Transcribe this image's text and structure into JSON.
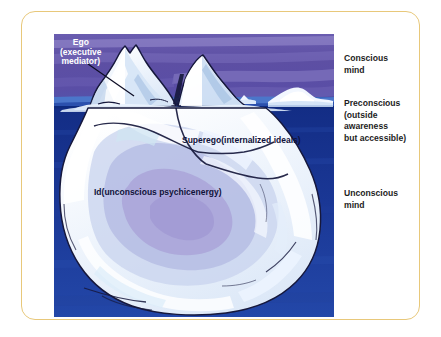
{
  "figure": {
    "frame_border_color": "#e8c87a",
    "background_color": "#ffffff"
  },
  "illustration": {
    "name": "freud-iceberg-illustration",
    "sky_color": "#5f51a4",
    "sky_light_band_color": "#8f86c4",
    "surface_water_color": "#2c56b4",
    "deep_water_color": "#15308a",
    "iceberg_white": "#f4f8ff",
    "iceberg_shadow": "#a9a8d4",
    "iceberg_pale_blue": "#cfe2f5",
    "outline_color": "#12122e",
    "waterline_y": 73,
    "labels": [
      {
        "id": "ego",
        "lines": [
          "Ego",
          "(executive",
          "mediator)"
        ],
        "color": "#ffffff",
        "pointer": true
      },
      {
        "id": "superego",
        "lines": [
          "Superego",
          "(internalized ideals)"
        ],
        "color": "#10123a",
        "pointer": false
      },
      {
        "id": "id",
        "lines": [
          "Id",
          "(unconscious psychic",
          "energy)"
        ],
        "color": "#10123a",
        "pointer": false
      }
    ]
  },
  "side_labels": {
    "conscious": "Conscious\nmind",
    "preconscious": "Preconscious\n(outside awareness\nbut accessible)",
    "unconscious": "Unconscious mind",
    "text_color": "#1d1d1d"
  }
}
